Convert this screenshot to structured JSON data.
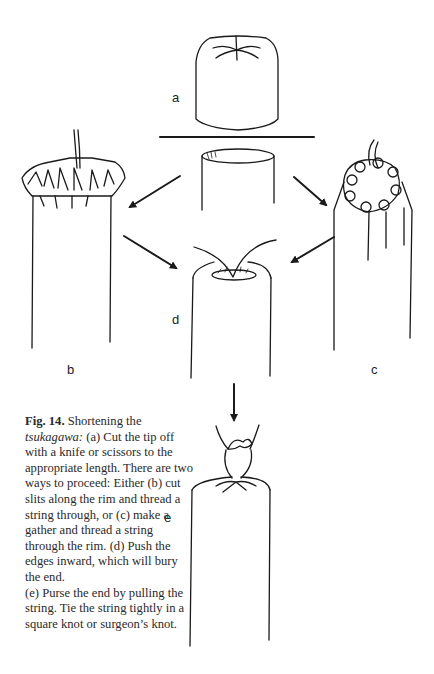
{
  "figure": {
    "labels": {
      "a": "a",
      "b": "b",
      "c": "c",
      "d": "d",
      "e": "e"
    },
    "caption": {
      "fig_label": "Fig. 14.",
      "title_lead": " Shortening the ",
      "term": "tsukagawa:",
      "body_1": " (a) Cut the tip off with a knife or scissors to the appropriate length. There are two ways to proceed: Either (b) cut slits along the rim and thread a string through, or (c) make a gather and thread a string through the rim. (d) Push the edges inward, which will bury the end.",
      "body_2": "(e) Purse the end by pulling the string. Tie the string tightly in a square knot or surgeon’s knot."
    },
    "colors": {
      "ink": "#1a1a1a",
      "background": "#ffffff"
    }
  }
}
